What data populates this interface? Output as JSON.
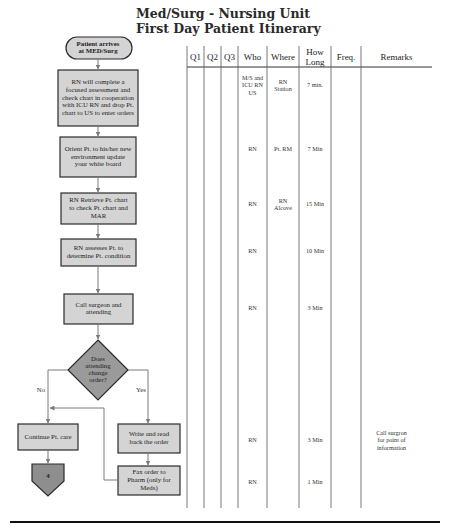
{
  "title": {
    "line1": "Med/Surg - Nursing Unit",
    "line2": "First Day Patient Itinerary"
  },
  "flow": {
    "start": [
      "Patient arrives",
      "at MED/Surg"
    ],
    "steps": [
      [
        "RN will complete a",
        "focused assessment and",
        "check chart in cooperation",
        "with ICU RN and drop Pt.",
        "chart to US to enter orders"
      ],
      [
        "Orient Pt. to his/her new",
        "environment update",
        "your white board"
      ],
      [
        "RN Retrieve Pt. chart",
        "to check Pt. chart and",
        "MAR"
      ],
      [
        "RN assesses Pt. to",
        "determine Pt. condition"
      ],
      [
        "Call surgeon and",
        "attending"
      ]
    ],
    "decision": [
      "Does",
      "attending",
      "change",
      "order?"
    ],
    "no_label": "No",
    "yes_label": "Yes",
    "no_step": [
      "Continue Pt. care"
    ],
    "yes_steps": [
      [
        "Write and read",
        "back the order"
      ],
      [
        "Fax order to",
        "Pharm (only for",
        "Meds)"
      ]
    ],
    "connector": "4"
  },
  "table": {
    "headers": [
      "Q1",
      "Q2",
      "Q3",
      "Who",
      "Where",
      [
        "How",
        "Long"
      ],
      "Freq.",
      "Remarks"
    ],
    "rows": [
      {
        "who": [
          "M/S and",
          "ICU RN",
          "US"
        ],
        "where": [
          "RN",
          "Station"
        ],
        "how_long": [
          "7 min."
        ],
        "freq": [],
        "remarks": []
      },
      {
        "who": [
          "RN"
        ],
        "where": [
          "Pt. RM"
        ],
        "how_long": [
          "7 Min"
        ],
        "freq": [],
        "remarks": []
      },
      {
        "who": [
          "RN"
        ],
        "where": [
          "RN",
          "Alcove"
        ],
        "how_long": [
          "15 Min"
        ],
        "freq": [],
        "remarks": []
      },
      {
        "who": [
          "RN"
        ],
        "where": [],
        "how_long": [
          "10 Min"
        ],
        "freq": [],
        "remarks": []
      },
      {
        "who": [
          "RN"
        ],
        "where": [],
        "how_long": [
          "3 Min"
        ],
        "freq": [],
        "remarks": []
      },
      {
        "who": [
          "RN"
        ],
        "where": [],
        "how_long": [
          "3 Min"
        ],
        "freq": [],
        "remarks": [
          "Call surgron",
          "for point of",
          "information"
        ]
      },
      {
        "who": [
          "RN"
        ],
        "where": [],
        "how_long": [
          "1 Min"
        ],
        "freq": [],
        "remarks": []
      }
    ]
  },
  "colors": {
    "box_fill": "#d4d4d4",
    "dark_fill": "#8e8e8e",
    "decision_fill": "#9a9a9a",
    "stroke": "#2b2b2b",
    "arrow": "#7a7a7a"
  }
}
